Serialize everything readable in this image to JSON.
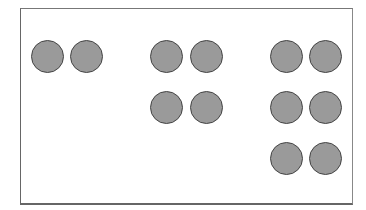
{
  "diagram": {
    "frame": {
      "border_color": "#666666",
      "background": "#ffffff"
    },
    "circle_style": {
      "fill": "#9a9a9a",
      "stroke": "#444444",
      "diameter": 33
    },
    "groups": [
      {
        "name": "group-1",
        "rows": 1,
        "cols": 2,
        "count": 2,
        "circles": [
          {
            "cx": 47,
            "cy": 56
          },
          {
            "cx": 86,
            "cy": 56
          }
        ]
      },
      {
        "name": "group-2",
        "rows": 2,
        "cols": 2,
        "count": 4,
        "circles": [
          {
            "cx": 166,
            "cy": 56
          },
          {
            "cx": 206,
            "cy": 56
          },
          {
            "cx": 166,
            "cy": 107
          },
          {
            "cx": 206,
            "cy": 107
          }
        ]
      },
      {
        "name": "group-3",
        "rows": 3,
        "cols": 2,
        "count": 6,
        "circles": [
          {
            "cx": 286,
            "cy": 56
          },
          {
            "cx": 325,
            "cy": 56
          },
          {
            "cx": 286,
            "cy": 107
          },
          {
            "cx": 325,
            "cy": 107
          },
          {
            "cx": 286,
            "cy": 158
          },
          {
            "cx": 325,
            "cy": 158
          }
        ]
      }
    ]
  }
}
